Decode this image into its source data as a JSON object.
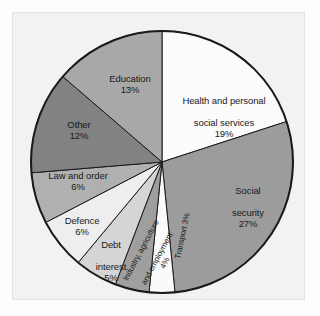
{
  "chart_data": {
    "type": "pie",
    "title": "",
    "xlabel": "",
    "ylabel": "",
    "unit": "%",
    "start_angle_deg": 0,
    "direction": "clockwise",
    "legend": "none",
    "grid": false,
    "categories": [
      "Health and personal social services",
      "Social security",
      "Transport",
      "Industry, agriculture and employment",
      "Debt interest",
      "Defence",
      "Law and order",
      "Other",
      "Education"
    ],
    "values": [
      19,
      27,
      3,
      4,
      5,
      6,
      6,
      12,
      13
    ],
    "slices": [
      {
        "label": "Health and personal\nsocial services",
        "label_line1": "Health and personal",
        "label_line2": "social services",
        "percent_text": "19%",
        "value": 19,
        "color": "#fbfbfb",
        "rotated": false
      },
      {
        "label": "Social\nsecurity",
        "label_line1": "Social",
        "label_line2": "security",
        "percent_text": "27%",
        "value": 27,
        "color": "#9c9c9c",
        "rotated": false
      },
      {
        "label": "Transport 3%",
        "label_line1": "Transport 3%",
        "label_line2": "",
        "percent_text": "3%",
        "value": 3,
        "color": "#fafafa",
        "rotated": true
      },
      {
        "label": "Industry, agriculture\nand employment\n4%",
        "label_line1": "Industry, agriculture",
        "label_line2": "and employment",
        "percent_text": "4%",
        "value": 4,
        "color": "#9f9f9f",
        "rotated": true
      },
      {
        "label": "Debt\ninterest",
        "label_line1": "Debt",
        "label_line2": "interest",
        "percent_text": "5%",
        "value": 5,
        "color": "#d5d5d5",
        "rotated": false
      },
      {
        "label": "Defence",
        "label_line1": "Defence",
        "label_line2": "",
        "percent_text": "6%",
        "value": 6,
        "color": "#eeeeee",
        "rotated": false
      },
      {
        "label": "Law and order",
        "label_line1": "Law and order",
        "label_line2": "",
        "percent_text": "6%",
        "value": 6,
        "color": "#b0b0b0",
        "rotated": false
      },
      {
        "label": "Other",
        "label_line1": "Other",
        "label_line2": "",
        "percent_text": "12%",
        "value": 12,
        "color": "#828282",
        "rotated": false
      },
      {
        "label": "Education",
        "label_line1": "Education",
        "label_line2": "",
        "percent_text": "13%",
        "value": 13,
        "color": "#a8a8a8",
        "rotated": false
      }
    ],
    "geometry": {
      "center_x": 162,
      "center_y": 162,
      "radius": 131
    },
    "style": {
      "outline_color": "#1a1a1a",
      "frame_color": "#f2f2f2",
      "background": "#fdfdfd",
      "text_color": "#1a1a1a"
    }
  }
}
